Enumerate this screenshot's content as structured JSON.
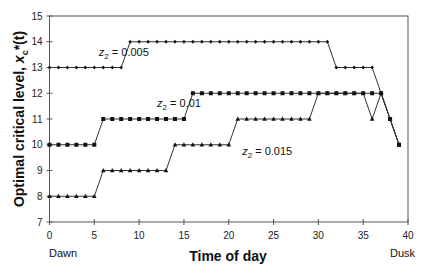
{
  "chart_data": {
    "type": "line",
    "title": "",
    "xlabel": "Time of day",
    "ylabel": "Optimal critical level, x_c*(t)",
    "xlim": [
      0,
      40
    ],
    "ylim": [
      7,
      15
    ],
    "x_ticks": [
      0,
      5,
      10,
      15,
      20,
      25,
      30,
      35,
      40
    ],
    "y_ticks": [
      7,
      8,
      9,
      10,
      11,
      12,
      13,
      14,
      15
    ],
    "x_endpoints": {
      "start": "Dawn",
      "end": "Dusk"
    },
    "grid": false,
    "legend": "inline annotations",
    "x": [
      0,
      1,
      2,
      3,
      4,
      5,
      6,
      7,
      8,
      9,
      10,
      11,
      12,
      13,
      14,
      15,
      16,
      17,
      18,
      19,
      20,
      21,
      22,
      23,
      24,
      25,
      26,
      27,
      28,
      29,
      30,
      31,
      32,
      33,
      34,
      35,
      36,
      37,
      38,
      39
    ],
    "series": [
      {
        "name": "z2 = 0.005",
        "marker": "diamond",
        "values": [
          13,
          13,
          13,
          13,
          13,
          13,
          13,
          13,
          13,
          14,
          14,
          14,
          14,
          14,
          14,
          14,
          14,
          14,
          14,
          14,
          14,
          14,
          14,
          14,
          14,
          14,
          14,
          14,
          14,
          14,
          14,
          14,
          13,
          13,
          13,
          13,
          13,
          12,
          11,
          10
        ]
      },
      {
        "name": "z2 = 0.01",
        "marker": "square",
        "values": [
          10,
          10,
          10,
          10,
          10,
          10,
          11,
          11,
          11,
          11,
          11,
          11,
          11,
          11,
          11,
          11,
          12,
          12,
          12,
          12,
          12,
          12,
          12,
          12,
          12,
          12,
          12,
          12,
          12,
          12,
          12,
          12,
          12,
          12,
          12,
          12,
          12,
          12,
          11,
          10
        ]
      },
      {
        "name": "z2 = 0.015",
        "marker": "triangle",
        "values": [
          8,
          8,
          8,
          8,
          8,
          8,
          9,
          9,
          9,
          9,
          9,
          9,
          9,
          9,
          10,
          10,
          10,
          10,
          10,
          10,
          10,
          11,
          11,
          11,
          11,
          11,
          11,
          11,
          11,
          11,
          12,
          12,
          12,
          12,
          12,
          12,
          11,
          12,
          11,
          10
        ]
      }
    ],
    "annotations": [
      {
        "text_prefix": "z",
        "subscript": "2",
        "text_suffix": " = 0.005",
        "x": 5.5,
        "y": 13.45
      },
      {
        "text_prefix": "z",
        "subscript": "2",
        "text_suffix": " = 0.01",
        "x": 12,
        "y": 11.45
      },
      {
        "text_prefix": "z",
        "subscript": "2",
        "text_suffix": " = 0.015",
        "x": 21.5,
        "y": 9.6
      }
    ]
  },
  "labels": {
    "xlabel": "Time of day",
    "ylabel_main": "Optimal critical level, ",
    "ylabel_var": "x",
    "ylabel_sub": "c",
    "ylabel_tail": "*(t)",
    "dawn": "Dawn",
    "dusk": "Dusk"
  },
  "colors": {
    "line": "#333333",
    "axis": "#555555",
    "text": "#111111"
  }
}
